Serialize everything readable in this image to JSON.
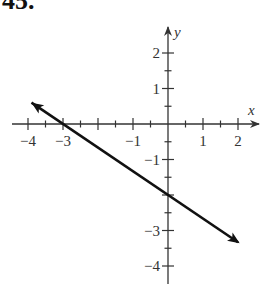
{
  "problem": {
    "number": "45."
  },
  "chart_data": {
    "type": "line",
    "title": "",
    "xlabel": "x",
    "ylabel": "y",
    "xlim": [
      -4.5,
      2.6
    ],
    "ylim": [
      -4.5,
      2.7
    ],
    "grid": false,
    "x_ticks_major": [
      -4,
      -3,
      -2,
      -1,
      0,
      1,
      2
    ],
    "x_tick_labels": [
      {
        "value": -4,
        "label": "−4"
      },
      {
        "value": -3,
        "label": "−3"
      },
      {
        "value": -1,
        "label": "−1"
      },
      {
        "value": 1,
        "label": "1"
      },
      {
        "value": 2,
        "label": "2"
      }
    ],
    "y_ticks_major": [
      -4,
      -3,
      -2,
      -1,
      0,
      1,
      2
    ],
    "y_tick_labels": [
      {
        "value": 2,
        "label": "2"
      },
      {
        "value": 1,
        "label": "1"
      },
      {
        "value": -1,
        "label": "−1"
      },
      {
        "value": -3,
        "label": "−3"
      },
      {
        "value": -4,
        "label": "−4"
      }
    ],
    "minor_tick_step": 0.5,
    "series": [
      {
        "name": "line",
        "equation": "y = -2/3 x - 2",
        "slope": -0.6667,
        "y_intercept": -2,
        "x_intercept": -3,
        "x": [
          -3.9,
          -3,
          0,
          2
        ],
        "y": [
          0.6,
          0,
          -2,
          -3.33
        ],
        "arrows": "both",
        "color": "#111111"
      }
    ]
  }
}
